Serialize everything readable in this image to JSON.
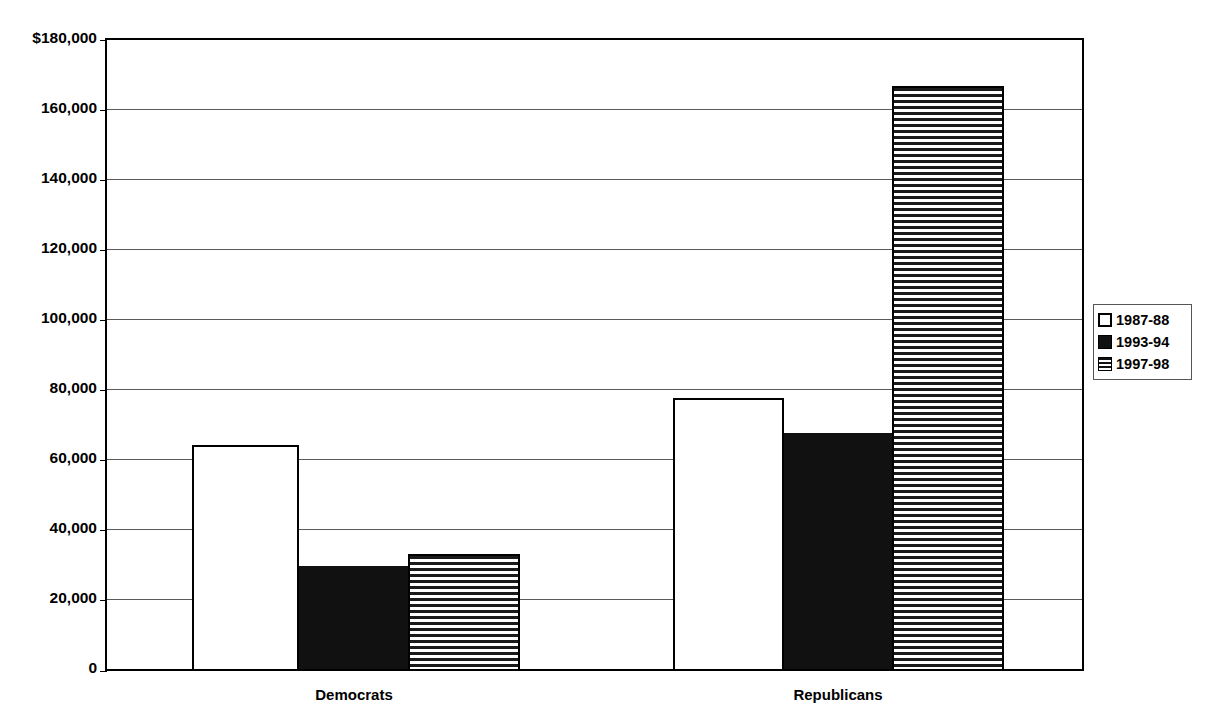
{
  "chart_data": {
    "type": "bar",
    "title": "",
    "subtitle": "",
    "xlabel": "",
    "ylabel": "",
    "categories": [
      "Democrats",
      "Republicans"
    ],
    "series": [
      {
        "name": "1987-88",
        "values": [
          64000,
          77500
        ],
        "style": "white-outline"
      },
      {
        "name": "1993-94",
        "values": [
          29500,
          67500
        ],
        "style": "solid-black"
      },
      {
        "name": "1997-98",
        "values": [
          33000,
          166500
        ],
        "style": "horizontal-stripes"
      }
    ],
    "ylim": [
      0,
      180000
    ],
    "ytick_values": [
      0,
      20000,
      40000,
      60000,
      80000,
      100000,
      120000,
      140000,
      160000,
      180000
    ],
    "ytick_labels": [
      "0",
      "20,000",
      "40,000",
      "60,000",
      "80,000",
      "100,000",
      "120,000",
      "140,000",
      "160,000",
      "$180,000"
    ],
    "grid": true,
    "grid_axis": "y",
    "legend_position": "right",
    "legend_entries": [
      "1987-88",
      "1993-94",
      "1997-98"
    ],
    "bar_gap_within_group": 0,
    "colors": {
      "axis": "#000000",
      "grid": "#5a5a5a",
      "series_1987_88_fill": "#ffffff",
      "series_1993_94_fill": "#111111",
      "series_1997_98_fill": "#ffffff",
      "series_1997_98_stripe": "#1a1a1a",
      "background": "#ffffff",
      "text": "#000000"
    }
  },
  "legend": {
    "items": [
      {
        "label": "1987-88"
      },
      {
        "label": "1993-94"
      },
      {
        "label": "1997-98"
      }
    ]
  },
  "axis": {
    "y_labels": [
      {
        "text": "$180,000",
        "value": 180000
      },
      {
        "text": "160,000",
        "value": 160000
      },
      {
        "text": "140,000",
        "value": 140000
      },
      {
        "text": "120,000",
        "value": 120000
      },
      {
        "text": "100,000",
        "value": 100000
      },
      {
        "text": "80,000",
        "value": 80000
      },
      {
        "text": "60,000",
        "value": 60000
      },
      {
        "text": "40,000",
        "value": 40000
      },
      {
        "text": "20,000",
        "value": 20000
      },
      {
        "text": "0",
        "value": 0
      }
    ],
    "x_labels": [
      {
        "text": "Democrats"
      },
      {
        "text": "Republicans"
      }
    ]
  }
}
